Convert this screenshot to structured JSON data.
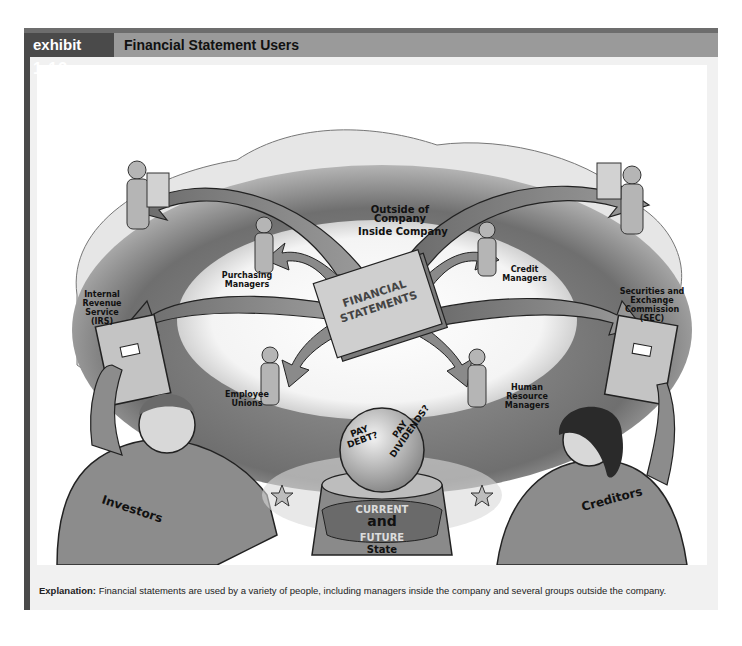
{
  "header": {
    "tag_prefix": "exhibit",
    "tag_number": "1.13",
    "title": "Financial Statement Users"
  },
  "illustration": {
    "zones": {
      "outside": "Outside of Company",
      "inside": "Inside Company"
    },
    "center_document": [
      "FINANCIAL",
      "STATEMENTS"
    ],
    "inside_users": [
      {
        "label": "Purchasing Managers"
      },
      {
        "label": "Credit Managers"
      },
      {
        "label": "Employee Unions"
      },
      {
        "label": "Human Resource Managers"
      }
    ],
    "outside_users": [
      {
        "label": "Internal Revenue Service (IRS)"
      },
      {
        "label": "Securities and Exchange Commission (SEC)"
      },
      {
        "label": "Investors"
      },
      {
        "label": "Creditors"
      }
    ],
    "crystal_ball": {
      "left_text": [
        "PAY",
        "DEBT?"
      ],
      "right_text": [
        "PAY",
        "DIVIDENDS?"
      ],
      "band_top": "CURRENT",
      "band_mid": "and",
      "band_bottom": "FUTURE",
      "base": "State"
    }
  },
  "caption": {
    "label": "Explanation:",
    "text": " Financial statements are used by a variety of people, including managers inside the company and several groups outside the company."
  },
  "colors": {
    "frame_dark": "#4a4a4a",
    "header_bar": "#9a9a9a",
    "panel_bg": "#f1f1f1"
  }
}
